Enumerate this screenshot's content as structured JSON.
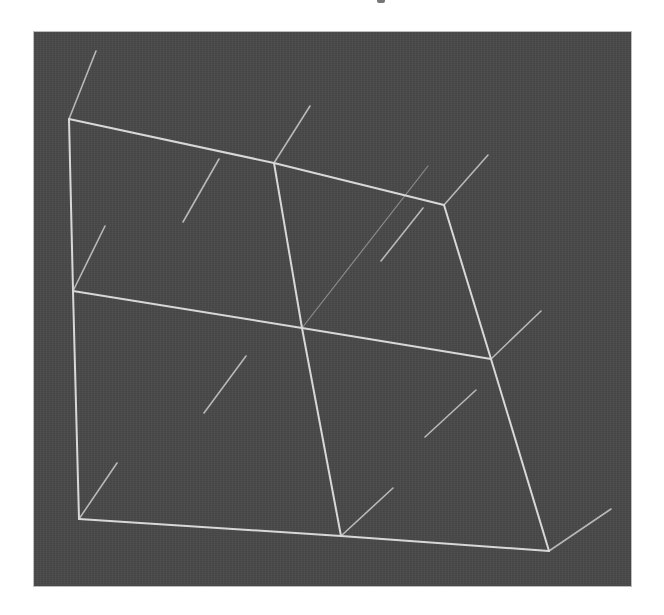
{
  "figure": {
    "type": "3d-wireframe-mesh",
    "colors": {
      "background": "#4a4a4a",
      "frame_border": "#bdbdbd",
      "edge": "#d8d8d8",
      "stub": "#b8b8b8",
      "faint_stub": "#8a8a8a"
    },
    "viewport": {
      "x": 33,
      "y": 31,
      "width": 599,
      "height": 556
    },
    "vertices": {
      "top_left": [
        68,
        118
      ],
      "top_mid": [
        273,
        162
      ],
      "top_right": [
        443,
        204
      ],
      "mid_left": [
        72,
        290
      ],
      "center": [
        301,
        327
      ],
      "mid_right": [
        490,
        358
      ],
      "bottom_left": [
        78,
        518
      ],
      "bottom_mid": [
        340,
        535
      ],
      "bottom_right": [
        548,
        550
      ]
    },
    "edges": [
      [
        "top_left",
        "top_mid"
      ],
      [
        "top_mid",
        "top_right"
      ],
      [
        "mid_left",
        "center"
      ],
      [
        "center",
        "mid_right"
      ],
      [
        "bottom_left",
        "bottom_mid"
      ],
      [
        "bottom_mid",
        "bottom_right"
      ],
      [
        "top_left",
        "mid_left"
      ],
      [
        "mid_left",
        "bottom_left"
      ],
      [
        "top_mid",
        "center"
      ],
      [
        "center",
        "bottom_mid"
      ],
      [
        "top_right",
        "mid_right"
      ],
      [
        "mid_right",
        "bottom_right"
      ]
    ],
    "vertex_stubs": [
      {
        "from": [
          68,
          118
        ],
        "to": [
          95,
          50
        ]
      },
      {
        "from": [
          273,
          162
        ],
        "to": [
          309,
          105
        ]
      },
      {
        "from": [
          443,
          204
        ],
        "to": [
          487,
          154
        ]
      },
      {
        "from": [
          72,
          290
        ],
        "to": [
          104,
          225
        ]
      },
      {
        "from": [
          490,
          358
        ],
        "to": [
          540,
          310
        ]
      },
      {
        "from": [
          78,
          518
        ],
        "to": [
          116,
          462
        ]
      },
      {
        "from": [
          340,
          535
        ],
        "to": [
          392,
          487
        ]
      },
      {
        "from": [
          548,
          550
        ],
        "to": [
          610,
          508
        ]
      }
    ],
    "face_stubs": [
      {
        "from": [
          182,
          221
        ],
        "to": [
          218,
          158
        ]
      },
      {
        "from": [
          380,
          260
        ],
        "to": [
          422,
          207
        ]
      },
      {
        "from": [
          203,
          412
        ],
        "to": [
          245,
          355
        ]
      },
      {
        "from": [
          424,
          436
        ],
        "to": [
          475,
          389
        ]
      }
    ],
    "faint_stubs": [
      {
        "from": [
          301,
          327
        ],
        "to": [
          427,
          165
        ]
      }
    ]
  }
}
